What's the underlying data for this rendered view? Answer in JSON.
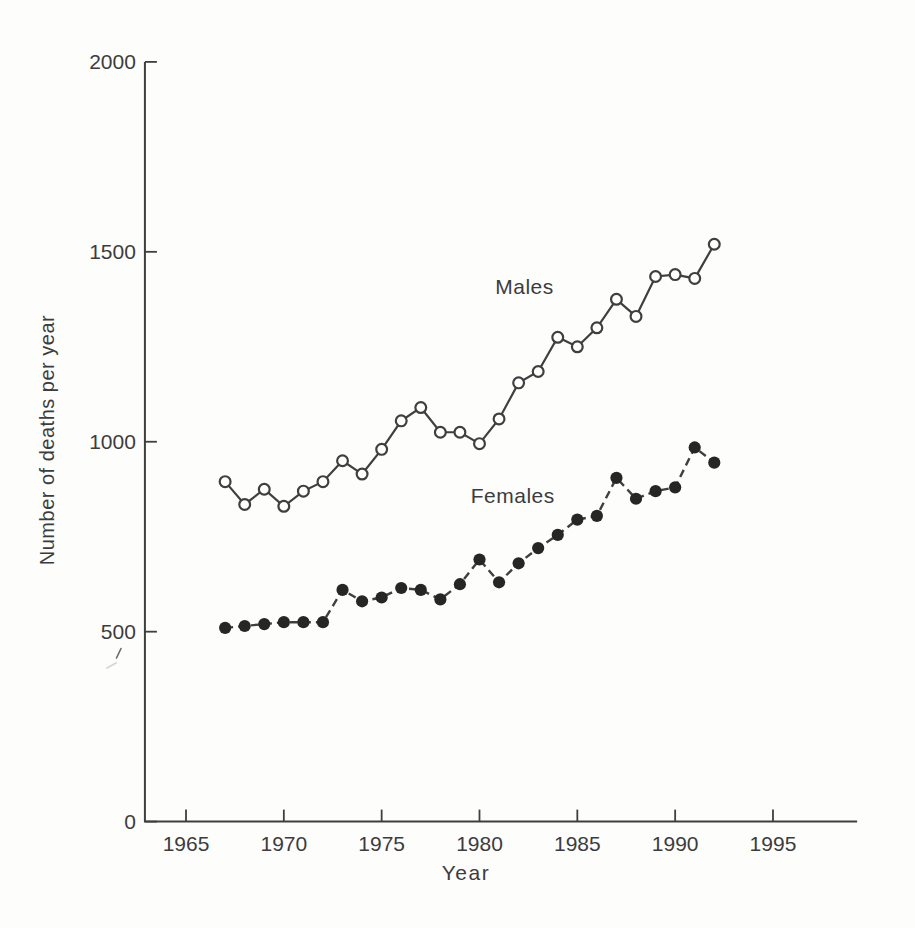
{
  "page": {
    "background": "#fdfdfc",
    "ink_color": "#3f3f3f",
    "text_color": "#3c3c3c",
    "marker_fill_color": "#262626"
  },
  "chart_data": {
    "type": "line",
    "title": "",
    "xlabel": "Year",
    "ylabel": "Number of deaths per year",
    "grid": false,
    "legend_position": "inline-annotations",
    "xlim": [
      1962.9,
      1999.3
    ],
    "ylim": [
      0,
      2000
    ],
    "x_ticks": [
      1965,
      1970,
      1975,
      1980,
      1985,
      1990,
      1995
    ],
    "y_ticks": [
      0,
      500,
      1000,
      1500,
      2000
    ],
    "x": [
      1967,
      1968,
      1969,
      1970,
      1971,
      1972,
      1973,
      1974,
      1975,
      1976,
      1977,
      1978,
      1979,
      1980,
      1981,
      1982,
      1983,
      1984,
      1985,
      1986,
      1987,
      1988,
      1989,
      1990,
      1991,
      1992
    ],
    "series": [
      {
        "name": "Males",
        "marker": "open-circle",
        "line_style": "solid",
        "values": [
          895,
          835,
          875,
          830,
          870,
          895,
          950,
          915,
          980,
          1055,
          1090,
          1025,
          1025,
          995,
          1060,
          1155,
          1185,
          1275,
          1250,
          1300,
          1375,
          1330,
          1435,
          1440,
          1430,
          1520
        ]
      },
      {
        "name": "Females",
        "marker": "filled-circle",
        "line_style": "dashed",
        "values": [
          510,
          515,
          520,
          525,
          525,
          525,
          610,
          580,
          590,
          615,
          610,
          585,
          625,
          690,
          630,
          680,
          720,
          755,
          795,
          805,
          905,
          850,
          870,
          880,
          985,
          945
        ]
      }
    ],
    "annotations": [
      {
        "label": "Males",
        "x": 1982.3,
        "y": 1408
      },
      {
        "label": "Females",
        "x": 1981.7,
        "y": 857
      }
    ]
  }
}
